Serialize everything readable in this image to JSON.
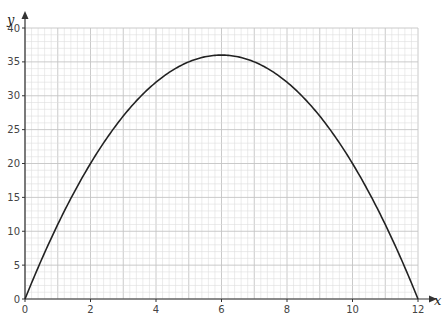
{
  "header_fragment": "...the graph of y...",
  "chart_data": {
    "type": "line",
    "title": "",
    "xlabel": "x",
    "ylabel": "y",
    "xlim": [
      0,
      12
    ],
    "ylim": [
      0,
      40
    ],
    "grid": true,
    "x_ticks": [
      0,
      2,
      4,
      6,
      8,
      10,
      12
    ],
    "y_ticks": [
      0,
      5,
      10,
      15,
      20,
      25,
      30,
      35,
      40
    ],
    "series": [
      {
        "name": "y = 12x - x^2",
        "x": [
          0,
          1,
          2,
          3,
          4,
          5,
          6,
          7,
          8,
          9,
          10,
          11,
          12
        ],
        "values": [
          0,
          11,
          20,
          27,
          32,
          35,
          36,
          35,
          32,
          27,
          20,
          11,
          0
        ],
        "color": "#222222"
      }
    ]
  },
  "colors": {
    "axis": "#333333",
    "grid_minor": "#dddddd",
    "grid_major": "#c4c4c4",
    "curve": "#222222"
  }
}
